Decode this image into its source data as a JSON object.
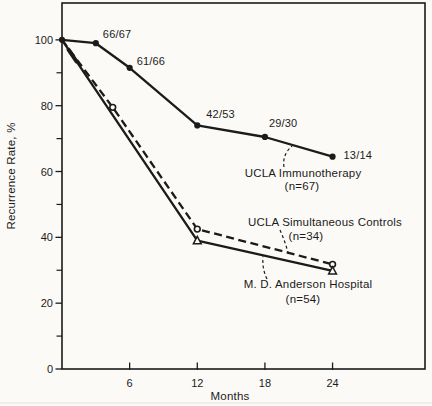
{
  "figure": {
    "background": "#fbfaf7",
    "ink": "#1b1b1b"
  },
  "chart_data": {
    "type": "line",
    "title": "",
    "xlabel": "Months",
    "ylabel": "Recurrence Rate, %",
    "xlim": [
      0,
      32.2
    ],
    "ylim": [
      0,
      111.2
    ],
    "x_ticks": [
      6,
      12,
      18,
      24
    ],
    "x_tick_labels": [
      "6",
      "12",
      "18",
      "24"
    ],
    "y_ticks_major": [
      0,
      20,
      40,
      60,
      80,
      100
    ],
    "y_tick_labels": [
      "0",
      "20",
      "40",
      "60",
      "80",
      "100"
    ],
    "y_ticks_minor": [
      10,
      30,
      50,
      70,
      90
    ],
    "grid": false,
    "legend_position": "inline-annotations",
    "series": [
      {
        "name": "UCLA Immunotherapy",
        "n_label": "(n=67)",
        "line_style": "solid",
        "marker": "filled-circle",
        "color": "#1b1b1b",
        "points": [
          {
            "x": 0,
            "y": 100
          },
          {
            "x": 3,
            "y": 99,
            "label": "66/67",
            "label_offset": [
              7,
              -5
            ]
          },
          {
            "x": 6,
            "y": 91.5,
            "label": "61/66",
            "label_offset": [
              7,
              -3
            ]
          },
          {
            "x": 12,
            "y": 74,
            "label": "42/53",
            "label_offset": [
              9,
              -7
            ]
          },
          {
            "x": 18,
            "y": 70.5,
            "label": "29/30",
            "label_offset": [
              4,
              -10
            ]
          },
          {
            "x": 24,
            "y": 64.5,
            "label": "13/14",
            "label_offset": [
              11,
              2
            ]
          }
        ],
        "annotation": {
          "text_x": 303,
          "text_y": 177,
          "n_x": 302,
          "n_y": 190,
          "leader": "M284,167 Q282,155 292,146"
        }
      },
      {
        "name": "UCLA Simultaneous Controls",
        "n_label": "(n=34)",
        "line_style": "dashed",
        "marker": "open-circle",
        "color": "#1b1b1b",
        "points": [
          {
            "x": 0,
            "y": 100,
            "marker": false
          },
          {
            "x": 4.5,
            "y": 79.5
          },
          {
            "x": 12,
            "y": 42.5
          },
          {
            "x": 24,
            "y": 31.8
          }
        ],
        "annotation": {
          "text_x": 325,
          "text_y": 226,
          "n_x": 306,
          "n_y": 240,
          "leader": "M280,230 Q285,241 288,252.5"
        }
      },
      {
        "name": "M. D. Anderson Hospital",
        "n_label": "(n=54)",
        "line_style": "solid",
        "marker": "open-triangle",
        "color": "#1b1b1b",
        "points": [
          {
            "x": 0,
            "y": 100,
            "marker": false
          },
          {
            "x": 12,
            "y": 39
          },
          {
            "x": 24,
            "y": 29.8
          }
        ],
        "annotation": {
          "text_x": 308,
          "text_y": 288,
          "n_x": 303,
          "n_y": 303,
          "leader": "M267,279 Q262,269 263,256.5"
        }
      }
    ]
  }
}
